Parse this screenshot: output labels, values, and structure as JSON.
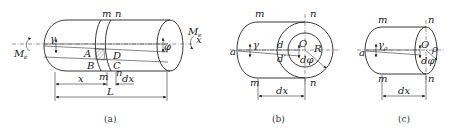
{
  "figure": {
    "panels": [
      {
        "id": "a",
        "caption": "(a)",
        "labels": {
          "torque_left": "M",
          "torque_left_sub": "e",
          "torque_right": "M",
          "torque_right_sub": "e",
          "axis": "x",
          "shear_angle": "γ",
          "twist_angle": "φ",
          "section_m_top": "m",
          "section_n_top": "n",
          "section_m_bottom": "m",
          "section_n_bottom": "n",
          "point_A": "A",
          "point_B": "B",
          "point_C": "C",
          "point_D": "D",
          "dim_x": "x",
          "dim_dx": "dx",
          "dim_L": "L"
        }
      },
      {
        "id": "b",
        "caption": "(b)",
        "labels": {
          "section_m_top": "m",
          "section_n_top": "n",
          "section_m_bottom": "m",
          "section_n_bottom": "n",
          "point_a": "a",
          "shear_angle": "γ",
          "point_d": "d",
          "point_d_prime": "d′",
          "center": "O",
          "radius": "R",
          "d_phi": "dφ",
          "dim_dx": "dx"
        }
      },
      {
        "id": "c",
        "caption": "(c)",
        "labels": {
          "section_m_top": "m",
          "section_n_top": "n",
          "section_m_bottom": "m",
          "section_n_bottom": "n",
          "point_a": "a",
          "shear_angle": "γ",
          "shear_angle_sub": "ρ",
          "center": "O",
          "radius": "ρ",
          "d_phi": "dφ",
          "dim_dx": "dx"
        }
      }
    ]
  }
}
